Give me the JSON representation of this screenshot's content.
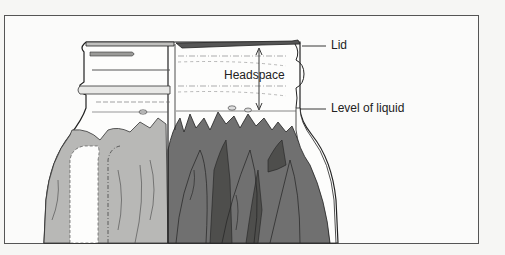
{
  "figure": {
    "type": "illustration",
    "labels": {
      "lid": "Lid",
      "headspace": "Headspace",
      "level_of_liquid": "Level of liquid"
    },
    "colors": {
      "background": "#f6f6f4",
      "frame": "#444444",
      "light_leaf": "#b4b4b2",
      "dark_leaf": "#6e6e6c",
      "darker_leaf": "#4a4a48",
      "outline": "#222222"
    }
  }
}
